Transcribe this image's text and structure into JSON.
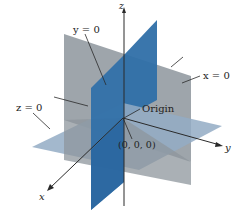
{
  "diagram": {
    "type": "coordinate-planes-3d",
    "axes": {
      "x": {
        "label": "x"
      },
      "y": {
        "label": "y"
      },
      "z": {
        "label": "z"
      }
    },
    "planes": [
      {
        "name": "y = 0",
        "label": "y = 0",
        "color": "#2f6fa8"
      },
      {
        "name": "x = 0",
        "label": "x = 0",
        "color": "#8d959c"
      },
      {
        "name": "z = 0",
        "label": "z = 0",
        "color": "#8fa9c2"
      }
    ],
    "annotations": {
      "origin_label": "Origin",
      "origin_coords": "(0, 0, 0)"
    },
    "colors": {
      "plane_y0": "#2f6fa8",
      "plane_x0": "#8d959c",
      "plane_z0": "#93acc4",
      "axis": "#2a2a2a",
      "background": "#ffffff"
    }
  }
}
